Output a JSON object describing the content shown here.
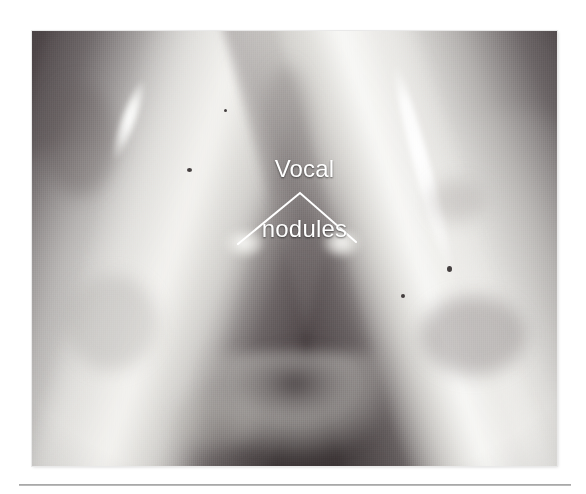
{
  "figure": {
    "type": "photograph",
    "modality": "laryngoscopy",
    "annotations": [
      {
        "id": "vocal-nodules",
        "label": "Vocal\nnodules",
        "label_line_1": "Vocal",
        "label_line_2": "nodules",
        "text_color": "#ffffff",
        "font_size_px": 24,
        "leader": {
          "style": "chevron",
          "color": "#ffffff",
          "stroke_width_px": 2,
          "apex": {
            "x": 300,
            "y": 193
          },
          "endpoints": [
            {
              "x": 238,
              "y": 244,
              "points_to": "left vocal fold nodule"
            },
            {
              "x": 356,
              "y": 242,
              "points_to": "right vocal fold nodule"
            }
          ]
        }
      }
    ],
    "plate": {
      "x": 32,
      "y": 31,
      "width": 525,
      "height": 435,
      "background_color": "#4c4446",
      "tissue_highlight_color": "#f0efec",
      "shadow_color": "#3a3234"
    }
  },
  "page": {
    "background_color": "#ffffff",
    "rule": {
      "x": 19,
      "y": 484,
      "width": 552,
      "height": 2,
      "color": "#9d9d9d"
    }
  },
  "icons": {
    "leader_line": "chevron-leader-icon"
  }
}
